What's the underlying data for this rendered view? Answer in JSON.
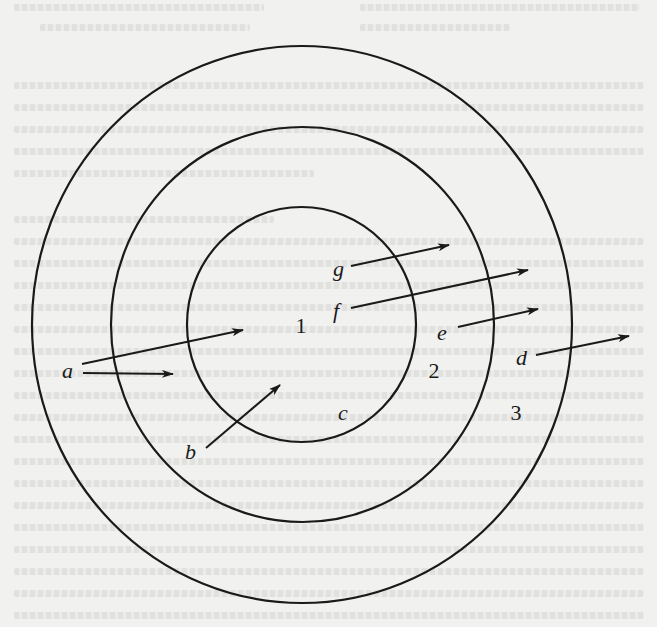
{
  "figure": {
    "regions": [
      {
        "id": "region-1",
        "label": "1",
        "x": 301,
        "y": 325
      },
      {
        "id": "region-2",
        "label": "2",
        "x": 434,
        "y": 370
      },
      {
        "id": "region-3",
        "label": "3",
        "x": 516,
        "y": 412
      }
    ],
    "circles": [
      {
        "id": "inner-circle",
        "cx": 301.5,
        "cy": 324.5,
        "rx": 114.5,
        "ry": 117.5
      },
      {
        "id": "middle-circle",
        "cx": 302.5,
        "cy": 324.5,
        "rx": 191.5,
        "ry": 197.5
      },
      {
        "id": "outer-circle",
        "cx": 302,
        "cy": 324.5,
        "rx": 270,
        "ry": 278.5
      }
    ],
    "arrows": [
      {
        "id": "arrow-a-upper",
        "label": "a",
        "x1": 82,
        "y1": 364,
        "x2": 243,
        "y2": 330
      },
      {
        "id": "arrow-a-lower",
        "label": "a",
        "x1": 83,
        "y1": 373,
        "x2": 173,
        "y2": 374
      },
      {
        "id": "arrow-b",
        "label": "b",
        "x1": 206,
        "y1": 448,
        "x2": 280,
        "y2": 385
      },
      {
        "id": "arrow-d",
        "label": "d",
        "x1": 536,
        "y1": 355,
        "x2": 629,
        "y2": 336
      },
      {
        "id": "arrow-e",
        "label": "e",
        "x1": 458,
        "y1": 327,
        "x2": 538,
        "y2": 309
      },
      {
        "id": "arrow-f",
        "label": "f",
        "x1": 351,
        "y1": 308,
        "x2": 528,
        "y2": 270
      },
      {
        "id": "arrow-g",
        "label": "g",
        "x1": 351,
        "y1": 266,
        "x2": 449,
        "y2": 245
      }
    ],
    "labels": [
      {
        "id": "label-a",
        "text": "a",
        "x": 62,
        "y": 378
      },
      {
        "id": "label-b",
        "text": "b",
        "x": 185,
        "y": 459
      },
      {
        "id": "label-c",
        "text": "c",
        "x": 338,
        "y": 420
      },
      {
        "id": "label-d",
        "text": "d",
        "x": 516,
        "y": 365
      },
      {
        "id": "label-e",
        "text": "e",
        "x": 437,
        "y": 340
      },
      {
        "id": "label-f",
        "text": "f",
        "x": 333,
        "y": 318
      },
      {
        "id": "label-g",
        "text": "g",
        "x": 333,
        "y": 276
      }
    ]
  },
  "colors": {
    "ink": "#1a1a1a",
    "paper": "#f1f1ef"
  }
}
